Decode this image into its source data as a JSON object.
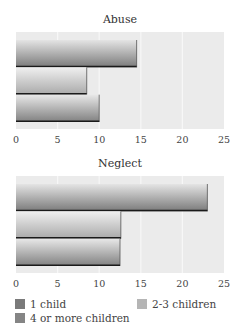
{
  "chart_data": [
    {
      "type": "bar",
      "orientation": "horizontal",
      "title": "Abuse",
      "categories": [
        "1 child",
        "2-3 children",
        "4 or more children"
      ],
      "values": [
        14.5,
        8.5,
        10
      ],
      "xlabel": "",
      "ylabel": "",
      "xlim": [
        0,
        25
      ],
      "xticks": [
        0,
        5,
        10,
        15,
        20,
        25
      ],
      "grid": true
    },
    {
      "type": "bar",
      "orientation": "horizontal",
      "title": "Neglect",
      "categories": [
        "1 child",
        "2-3 children",
        "4 or more children"
      ],
      "values": [
        23,
        12.6,
        12.5
      ],
      "xlabel": "",
      "ylabel": "",
      "xlim": [
        0,
        25
      ],
      "xticks": [
        0,
        5,
        10,
        15,
        20,
        25
      ],
      "grid": true
    }
  ],
  "legend": {
    "placement": "bottom",
    "items": [
      {
        "label": "1 child",
        "color": "#7a7a7a"
      },
      {
        "label": "2-3 children",
        "color": "#b5b5b5"
      },
      {
        "label": "4 or more children",
        "color": "#858585"
      }
    ]
  },
  "colors": {
    "plot_background": "#ebebeb",
    "gridline": "#f7f7f7",
    "bar_edge": "#1a1a1a"
  }
}
